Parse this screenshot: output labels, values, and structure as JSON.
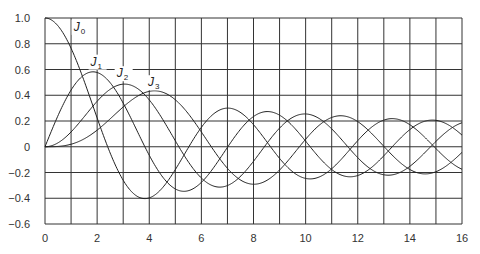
{
  "chart_data": {
    "type": "line",
    "title": "",
    "xlabel": "",
    "ylabel": "",
    "xlim": [
      0,
      16
    ],
    "ylim": [
      -0.6,
      1.0
    ],
    "grid": true,
    "x_ticks": [
      0,
      2,
      4,
      6,
      8,
      10,
      12,
      14,
      16
    ],
    "x_tick_labels": [
      "0",
      "2",
      "4",
      "6",
      "8",
      "10",
      "12",
      "14",
      "16"
    ],
    "x_grid_step": 1,
    "y_ticks": [
      -0.6,
      -0.4,
      -0.2,
      0,
      0.2,
      0.4,
      0.6,
      0.8,
      1.0
    ],
    "y_tick_labels": [
      "−0.6",
      "−0.4",
      "−0.2",
      "0",
      "0.2",
      "0.4",
      "0.6",
      "0.8",
      "1.0"
    ],
    "x": [
      0,
      1,
      2,
      3,
      4,
      5,
      6,
      7,
      8,
      9,
      10,
      11,
      12,
      13,
      14,
      15,
      16
    ],
    "series": [
      {
        "name": "J0",
        "order": 0,
        "label": "J",
        "sub": "0",
        "label_pos": [
          1.1,
          0.9
        ],
        "values": [
          1.0,
          0.765,
          0.224,
          -0.26,
          -0.397,
          -0.178,
          0.151,
          0.3,
          0.172,
          -0.09,
          -0.246,
          -0.171,
          0.048,
          0.207,
          0.171,
          -0.014,
          -0.175
        ]
      },
      {
        "name": "J1",
        "order": 1,
        "label": "J",
        "sub": "1",
        "label_pos": [
          1.75,
          0.63
        ],
        "values": [
          0.0,
          0.44,
          0.577,
          0.339,
          -0.066,
          -0.328,
          -0.277,
          -0.005,
          0.235,
          0.245,
          0.043,
          -0.177,
          -0.223,
          -0.07,
          0.133,
          0.205,
          0.09
        ]
      },
      {
        "name": "J2",
        "order": 2,
        "label": "J",
        "sub": "2",
        "label_pos": [
          2.75,
          0.54
        ],
        "values": [
          0.0,
          0.115,
          0.353,
          0.486,
          0.364,
          0.047,
          -0.243,
          -0.301,
          -0.113,
          0.145,
          0.255,
          0.139,
          -0.085,
          -0.218,
          -0.152,
          0.042,
          0.186
        ]
      },
      {
        "name": "J3",
        "order": 3,
        "label": "J",
        "sub": "3",
        "label_pos": [
          3.95,
          0.47
        ],
        "values": [
          0.0,
          0.02,
          0.129,
          0.309,
          0.43,
          0.365,
          0.115,
          -0.168,
          -0.291,
          -0.181,
          0.058,
          0.227,
          0.195,
          -0.003,
          -0.177,
          -0.194,
          -0.044
        ]
      }
    ],
    "colors": {
      "line": "#222222",
      "grid": "#333333",
      "axis": "#333333",
      "text": "#333333"
    }
  }
}
